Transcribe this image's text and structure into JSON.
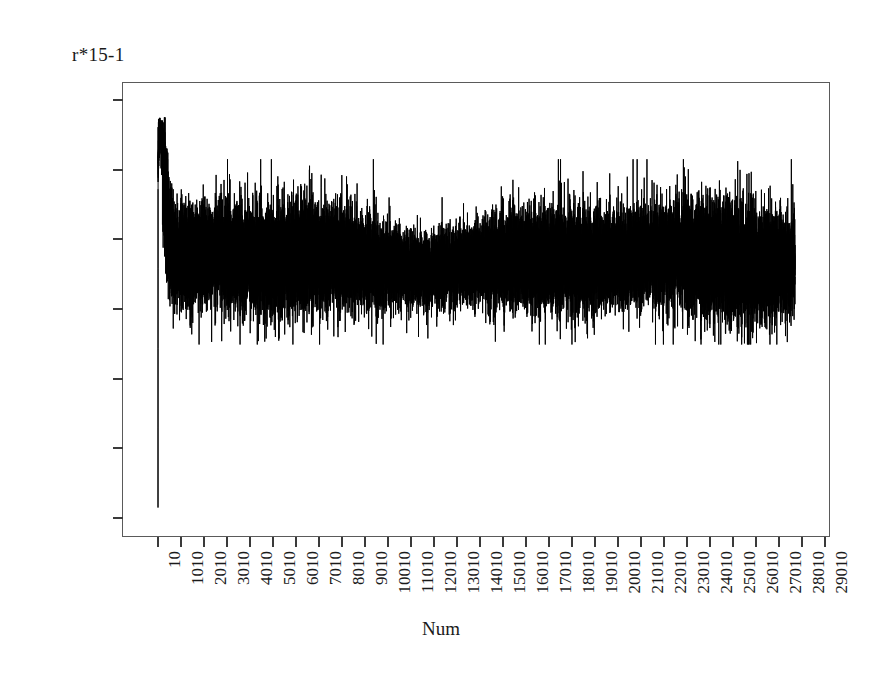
{
  "chart_data": {
    "type": "line",
    "title": "",
    "ylabel": "r*15-1",
    "xlabel": "Num",
    "ylim": [
      0.3,
      0.9
    ],
    "xlim": [
      10,
      29810
    ],
    "grid": false,
    "legend": null,
    "line_color": "#000000",
    "frame_color": "#5a5a5a",
    "background": "#ffffff",
    "y_ticks": [
      "0.9000",
      "0.8000",
      "0.7000",
      "0.6000",
      "0.5000",
      "0.4000",
      "0.3000"
    ],
    "y_tick_values": [
      0.9,
      0.8,
      0.7,
      0.6,
      0.5,
      0.4,
      0.3
    ],
    "x_ticks": [
      "10",
      "1010",
      "2010",
      "3010",
      "4010",
      "5010",
      "6010",
      "7010",
      "8010",
      "9010",
      "10010",
      "11010",
      "12010",
      "13010",
      "14010",
      "15010",
      "16010",
      "17010",
      "18010",
      "19010",
      "20010",
      "21010",
      "22010",
      "23010",
      "24010",
      "25010",
      "26010",
      "27010",
      "28010",
      "29010"
    ],
    "x_tick_values": [
      10,
      1010,
      2010,
      3010,
      4010,
      5010,
      6010,
      7010,
      8010,
      9010,
      10010,
      11010,
      12010,
      13010,
      14010,
      15010,
      16010,
      17010,
      18010,
      19010,
      20010,
      21010,
      22010,
      23010,
      24010,
      25010,
      26010,
      27010,
      28010,
      29010
    ],
    "series_description": "Single dense noisy trace: starts near 0.315, rises steeply to a maximum near 0.875 within the first few hundred samples, then settles into stationary high-frequency noise centred near 0.672 with typical excursions between 0.58 and 0.79 and rare extremes down to 0.55 and up to 0.815.",
    "start_value": 0.315,
    "peak_value": 0.875,
    "steady_mean": 0.672,
    "steady_min": 0.549,
    "steady_max": 0.815,
    "n_points": 29810
  }
}
